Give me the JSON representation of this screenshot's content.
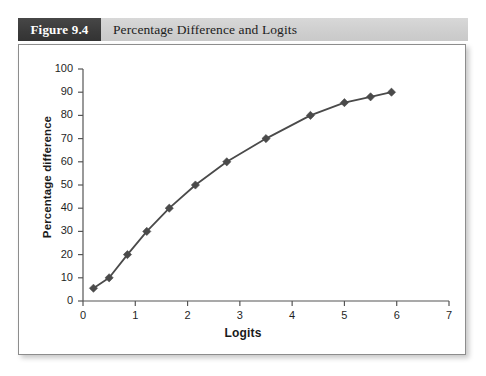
{
  "figure": {
    "tag": "Figure 9.4",
    "title": "Percentage Difference and Logits"
  },
  "colors": {
    "header_band": "#d2d2d2",
    "header_tag": "#3b3b3b",
    "series_line": "#4a4a4a",
    "marker": "#4a4a4a",
    "axis": "#555555",
    "panel_border": "#8d8d8d",
    "panel_background": "#ffffff"
  },
  "chart_data": {
    "type": "line",
    "title": "Percentage Difference and Logits",
    "xlabel": "Logits",
    "ylabel": "Percentage difference",
    "xlim": [
      0,
      7
    ],
    "ylim": [
      0,
      100
    ],
    "xticks": [
      0,
      1,
      2,
      3,
      4,
      5,
      6,
      7
    ],
    "yticks": [
      0,
      10,
      20,
      30,
      40,
      50,
      60,
      70,
      80,
      90,
      100
    ],
    "grid": false,
    "legend": null,
    "marker": "diamond",
    "series": [
      {
        "name": "Percentage difference",
        "x": [
          0.2,
          0.5,
          0.85,
          1.22,
          1.65,
          2.15,
          2.75,
          3.5,
          4.35,
          5.0,
          5.5,
          5.9
        ],
        "values": [
          5.5,
          10,
          20,
          30,
          40,
          50,
          60,
          70,
          80,
          85.5,
          88,
          90
        ]
      }
    ]
  }
}
